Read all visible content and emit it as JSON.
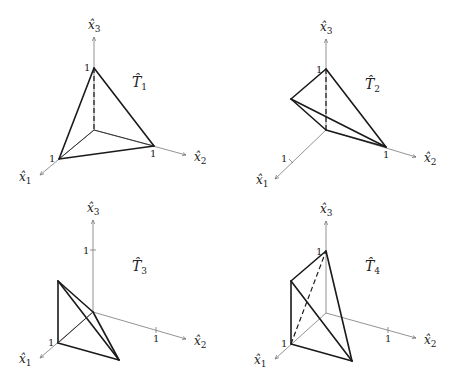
{
  "figure": {
    "panels": [
      {
        "title": "T̂",
        "subscript": "1",
        "axes": {
          "x1": "x̂",
          "x1_sub": "1",
          "x2": "x̂",
          "x2_sub": "2",
          "x3": "x̂",
          "x3_sub": "3"
        },
        "ticks": {
          "x1": "1",
          "x2": "1",
          "x3": "1"
        }
      },
      {
        "title": "T̂",
        "subscript": "2",
        "axes": {
          "x1": "x̂",
          "x1_sub": "1",
          "x2": "x̂",
          "x2_sub": "2",
          "x3": "x̂",
          "x3_sub": "3"
        },
        "ticks": {
          "x1": "1",
          "x2": "1",
          "x3": "1"
        }
      },
      {
        "title": "T̂",
        "subscript": "3",
        "axes": {
          "x1": "x̂",
          "x1_sub": "1",
          "x2": "x̂",
          "x2_sub": "2",
          "x3": "x̂",
          "x3_sub": "3"
        },
        "ticks": {
          "x1": "1",
          "x2": "1",
          "x3": "1"
        }
      },
      {
        "title": "T̂",
        "subscript": "4",
        "axes": {
          "x1": "x̂",
          "x1_sub": "1",
          "x2": "x̂",
          "x2_sub": "2",
          "x3": "x̂",
          "x3_sub": "3"
        },
        "ticks": {
          "x1": "1",
          "x2": "1",
          "x3": "1"
        }
      }
    ]
  }
}
